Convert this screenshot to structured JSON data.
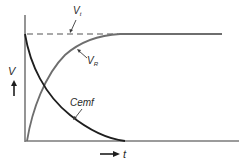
{
  "diagram": {
    "type": "rl-circuit-time-response",
    "colors": {
      "axis": "#7a7a7a",
      "vr_curve": "#6e6e6e",
      "cemf_curve": "#1e1e1e",
      "dashed_line": "#555555",
      "text": "#2a2a2a"
    },
    "axes": {
      "y_label": "V",
      "x_label": "t",
      "y_arrow": "up-arrow",
      "x_arrow": "right-arrow"
    },
    "curves": [
      {
        "name": "V_R",
        "label_main": "V",
        "label_sub": "R",
        "shape": "exponential-rise"
      },
      {
        "name": "Cemf",
        "label_main": "Cemf",
        "shape": "exponential-decay"
      }
    ],
    "reference_line": {
      "name": "V_t",
      "label_main": "V",
      "label_sub": "t",
      "style": "dashed"
    }
  }
}
